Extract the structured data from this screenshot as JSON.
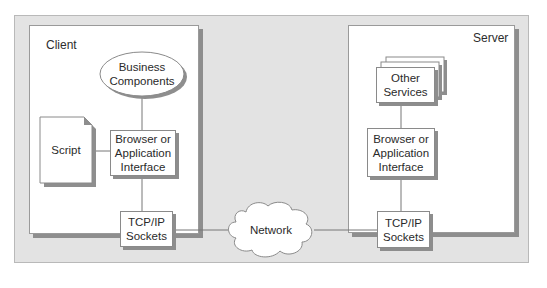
{
  "diagram": {
    "client": {
      "label": "Client",
      "business_components": "Business\nComponents",
      "script": "Script",
      "browser_interface": "Browser or\nApplication\nInterface",
      "tcpip_sockets": "TCP/IP\nSockets"
    },
    "network": {
      "label": "Network"
    },
    "server": {
      "label": "Server",
      "other_services": "Other\nServices",
      "browser_interface": "Browser or\nApplication\nInterface",
      "tcpip_sockets": "TCP/IP\nSockets"
    },
    "colors": {
      "panel_bg": "#e3e3e3",
      "box_bg": "#ffffff",
      "shadow": "#8e8e8e",
      "line": "#6e6e6e"
    }
  }
}
